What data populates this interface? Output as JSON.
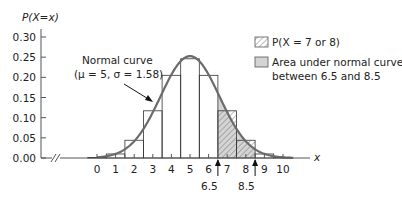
{
  "chart_data": {
    "type": "bar",
    "title": "",
    "ylabel": "P(X=x)",
    "xlabel": "x",
    "ylim": [
      0,
      0.3
    ],
    "yticks": [
      "0.00",
      "0.05",
      "0.10",
      "0.15",
      "0.20",
      "0.25",
      "0.30"
    ],
    "categories": [
      "0",
      "1",
      "2",
      "3",
      "4",
      "5",
      "6",
      "7",
      "8",
      "9",
      "10"
    ],
    "values": [
      0.001,
      0.01,
      0.044,
      0.117,
      0.205,
      0.246,
      0.205,
      0.117,
      0.044,
      0.01,
      0.001
    ],
    "series": [
      {
        "name": "P(X = x) histogram",
        "values": [
          0.001,
          0.01,
          0.044,
          0.117,
          0.205,
          0.246,
          0.205,
          0.117,
          0.044,
          0.01,
          0.001
        ]
      },
      {
        "name": "Normal curve",
        "mu": 5,
        "sigma": 1.58
      }
    ],
    "annotations": {
      "curve_label_line1": "Normal curve",
      "curve_label_line2": "(μ = 5, σ = 1.58)",
      "marker_left": "6.5",
      "marker_right": "8.5"
    },
    "legend": [
      {
        "label": "P(X = 7 or 8)",
        "style": "hatched"
      },
      {
        "label_line1": "Area under normal curve",
        "label_line2": "between 6.5 and 8.5",
        "style": "gray-fill"
      }
    ],
    "legend_position": "upper right",
    "grid": false
  },
  "colors": {
    "curve": "#6b6b6b",
    "shade": "#d4d4d4",
    "axis": "#555555",
    "text": "#222222"
  }
}
